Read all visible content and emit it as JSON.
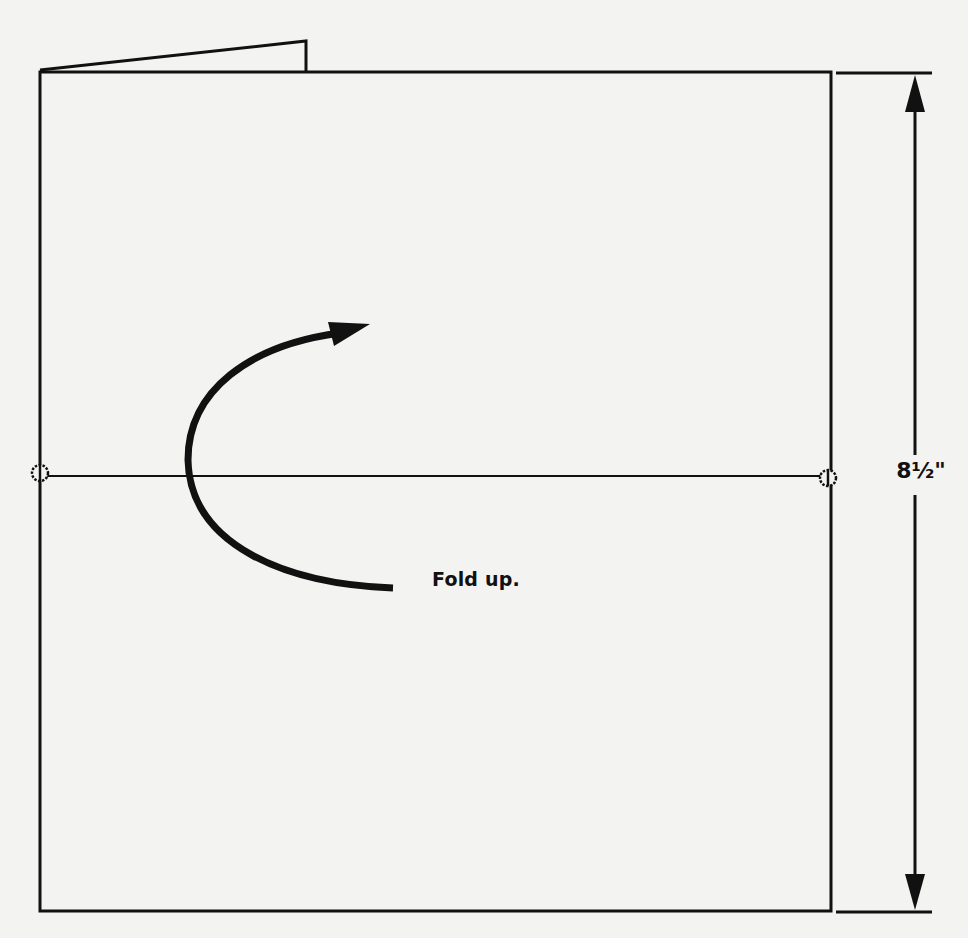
{
  "diagram": {
    "title": "",
    "instruction_label": "Fold up.",
    "dimension_label": "8½\"",
    "colors": {
      "ink": "#111111",
      "paper": "#f3f3f1"
    },
    "sheet": {
      "left": 40,
      "top": 72,
      "right": 831,
      "bottom": 911
    },
    "fold_line_y": 476,
    "fold_marks": [
      {
        "x": 40,
        "y": 476
      },
      {
        "x": 827,
        "y": 476
      }
    ],
    "dimension_line": {
      "x": 915,
      "top": 72,
      "bottom": 913
    },
    "fold_arrow": {
      "direction": "up",
      "shape": "curved"
    },
    "top_flap": {
      "points": "40,70 306,41 306,72"
    }
  }
}
